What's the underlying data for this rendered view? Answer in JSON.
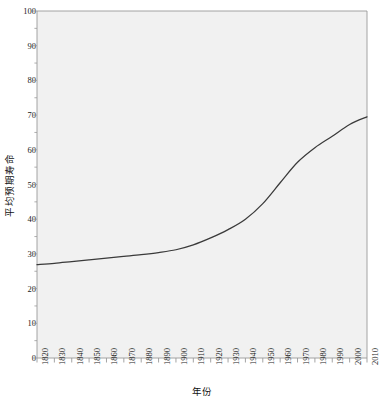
{
  "chart_data": {
    "type": "line",
    "title": "",
    "xlabel": "年份",
    "ylabel": "平均预期寿命",
    "xlim": [
      1820,
      2010
    ],
    "ylim": [
      0,
      100
    ],
    "grid": false,
    "legend": "none",
    "line_color": "#3a3a3a",
    "plot_bg": "#f1f1f1",
    "axis_color": "#9a9a9a",
    "x_tick_labels": [
      "1820",
      "1830",
      "1840",
      "1850",
      "1860",
      "1870",
      "1880",
      "1890",
      "1900",
      "1910",
      "1920",
      "1930",
      "1940",
      "1950",
      "1960",
      "1970",
      "1980",
      "1990",
      "2000",
      "2010"
    ],
    "y_tick_labels": [
      "0",
      "10",
      "20",
      "30",
      "40",
      "50",
      "60",
      "70",
      "80",
      "90",
      "100"
    ],
    "y_ticks": [
      0,
      10,
      20,
      30,
      40,
      50,
      60,
      70,
      80,
      90,
      100
    ],
    "x": [
      1820,
      1830,
      1840,
      1850,
      1860,
      1870,
      1880,
      1890,
      1900,
      1910,
      1920,
      1930,
      1940,
      1950,
      1960,
      1970,
      1980,
      1990,
      2000,
      2010
    ],
    "values": [
      26.9,
      27.3,
      27.8,
      28.3,
      28.8,
      29.3,
      29.8,
      30.4,
      31.2,
      32.6,
      34.6,
      37.0,
      40.0,
      44.5,
      50.5,
      56.4,
      60.6,
      63.9,
      67.3,
      69.5
    ],
    "series": [
      {
        "name": "平均预期寿命",
        "values": [
          26.9,
          27.3,
          27.8,
          28.3,
          28.8,
          29.3,
          29.8,
          30.4,
          31.2,
          32.6,
          34.6,
          37.0,
          40.0,
          44.5,
          50.5,
          56.4,
          60.6,
          63.9,
          67.3,
          69.5
        ]
      }
    ]
  }
}
